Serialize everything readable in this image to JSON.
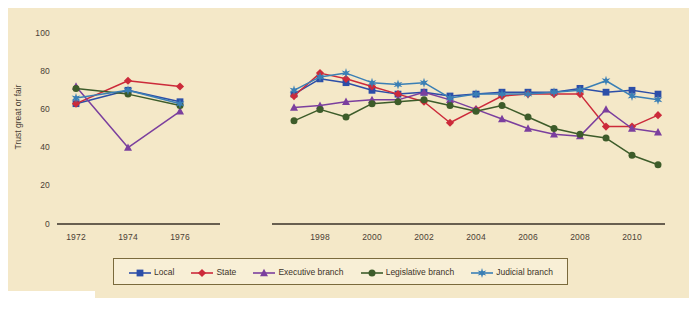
{
  "chart_data": {
    "type": "line",
    "title": "",
    "xlabel": "",
    "ylabel": "Trust great or fair",
    "ylim": [
      0,
      100
    ],
    "yticks": [
      0,
      20,
      40,
      60,
      80,
      100
    ],
    "xticks": [
      1972,
      1974,
      1976,
      1998,
      2000,
      2002,
      2004,
      2006,
      2008,
      2010
    ],
    "grid": false,
    "legend_position": "bottom",
    "axis_break": true,
    "series": [
      {
        "name": "Local",
        "color": "#2c4ea8",
        "marker": "square",
        "points": [
          {
            "x": 1972,
            "y": 63
          },
          {
            "x": 1974,
            "y": 70
          },
          {
            "x": 1976,
            "y": 64
          },
          {
            "x": 1997,
            "y": 68
          },
          {
            "x": 1998,
            "y": 76
          },
          {
            "x": 1999,
            "y": 74
          },
          {
            "x": 2000,
            "y": 70
          },
          {
            "x": 2001,
            "y": 68
          },
          {
            "x": 2002,
            "y": 69
          },
          {
            "x": 2003,
            "y": 67
          },
          {
            "x": 2004,
            "y": 68
          },
          {
            "x": 2005,
            "y": 69
          },
          {
            "x": 2006,
            "y": 69
          },
          {
            "x": 2007,
            "y": 69
          },
          {
            "x": 2008,
            "y": 71
          },
          {
            "x": 2009,
            "y": 69
          },
          {
            "x": 2010,
            "y": 70
          },
          {
            "x": 2011,
            "y": 68
          }
        ]
      },
      {
        "name": "State",
        "color": "#cc2a3a",
        "marker": "diamond",
        "points": [
          {
            "x": 1972,
            "y": 63
          },
          {
            "x": 1974,
            "y": 75
          },
          {
            "x": 1976,
            "y": 72
          },
          {
            "x": 1997,
            "y": 67
          },
          {
            "x": 1998,
            "y": 79
          },
          {
            "x": 1999,
            "y": 76
          },
          {
            "x": 2000,
            "y": 72
          },
          {
            "x": 2001,
            "y": 68
          },
          {
            "x": 2002,
            "y": 64
          },
          {
            "x": 2003,
            "y": 53
          },
          {
            "x": 2004,
            "y": 60
          },
          {
            "x": 2005,
            "y": 67
          },
          {
            "x": 2006,
            "y": 68
          },
          {
            "x": 2007,
            "y": 68
          },
          {
            "x": 2008,
            "y": 68
          },
          {
            "x": 2009,
            "y": 51
          },
          {
            "x": 2010,
            "y": 51
          },
          {
            "x": 2011,
            "y": 57
          }
        ]
      },
      {
        "name": "Executive branch",
        "color": "#7b3f9e",
        "marker": "triangle",
        "points": [
          {
            "x": 1972,
            "y": 72
          },
          {
            "x": 1974,
            "y": 40
          },
          {
            "x": 1976,
            "y": 59
          },
          {
            "x": 1997,
            "y": 61
          },
          {
            "x": 1998,
            "y": 62
          },
          {
            "x": 1999,
            "y": 64
          },
          {
            "x": 2000,
            "y": 65
          },
          {
            "x": 2001,
            "y": 65
          },
          {
            "x": 2002,
            "y": 69
          },
          {
            "x": 2003,
            "y": 65
          },
          {
            "x": 2004,
            "y": 60
          },
          {
            "x": 2005,
            "y": 55
          },
          {
            "x": 2006,
            "y": 50
          },
          {
            "x": 2007,
            "y": 47
          },
          {
            "x": 2008,
            "y": 46
          },
          {
            "x": 2009,
            "y": 60
          },
          {
            "x": 2010,
            "y": 50
          },
          {
            "x": 2011,
            "y": 48
          }
        ]
      },
      {
        "name": "Legislative branch",
        "color": "#3d5c2a",
        "marker": "circle",
        "points": [
          {
            "x": 1972,
            "y": 71
          },
          {
            "x": 1974,
            "y": 68
          },
          {
            "x": 1976,
            "y": 62
          },
          {
            "x": 1997,
            "y": 54
          },
          {
            "x": 1998,
            "y": 60
          },
          {
            "x": 1999,
            "y": 56
          },
          {
            "x": 2000,
            "y": 63
          },
          {
            "x": 2001,
            "y": 64
          },
          {
            "x": 2002,
            "y": 65
          },
          {
            "x": 2003,
            "y": 62
          },
          {
            "x": 2004,
            "y": 59
          },
          {
            "x": 2005,
            "y": 62
          },
          {
            "x": 2006,
            "y": 56
          },
          {
            "x": 2007,
            "y": 50
          },
          {
            "x": 2008,
            "y": 47
          },
          {
            "x": 2009,
            "y": 45
          },
          {
            "x": 2010,
            "y": 36
          },
          {
            "x": 2011,
            "y": 31
          }
        ]
      },
      {
        "name": "Judicial branch",
        "color": "#3a7fb5",
        "marker": "star",
        "points": [
          {
            "x": 1972,
            "y": 66
          },
          {
            "x": 1974,
            "y": 70
          },
          {
            "x": 1976,
            "y": 63
          },
          {
            "x": 1997,
            "y": 70
          },
          {
            "x": 1998,
            "y": 77
          },
          {
            "x": 1999,
            "y": 79
          },
          {
            "x": 2000,
            "y": 74
          },
          {
            "x": 2001,
            "y": 73
          },
          {
            "x": 2002,
            "y": 74
          },
          {
            "x": 2003,
            "y": 66
          },
          {
            "x": 2004,
            "y": 68
          },
          {
            "x": 2005,
            "y": 68
          },
          {
            "x": 2006,
            "y": 68
          },
          {
            "x": 2007,
            "y": 69
          },
          {
            "x": 2008,
            "y": 70
          },
          {
            "x": 2009,
            "y": 75
          },
          {
            "x": 2010,
            "y": 67
          },
          {
            "x": 2011,
            "y": 65
          }
        ]
      }
    ]
  },
  "axis": {
    "y_title": "Trust great or fair",
    "y_tick_labels": [
      "100",
      "80",
      "60",
      "40",
      "20",
      "0"
    ],
    "x_tick_labels": [
      "1972",
      "1974",
      "1976",
      "1998",
      "2000",
      "2002",
      "2004",
      "2006",
      "2008",
      "2010"
    ]
  },
  "legend": {
    "items": [
      {
        "label": "Local",
        "color": "#2c4ea8",
        "marker": "square"
      },
      {
        "label": "State",
        "color": "#cc2a3a",
        "marker": "diamond"
      },
      {
        "label": "Executive branch",
        "color": "#7b3f9e",
        "marker": "triangle"
      },
      {
        "label": "Legislative branch",
        "color": "#3d5c2a",
        "marker": "circle"
      },
      {
        "label": "Judicial branch",
        "color": "#3a7fb5",
        "marker": "star"
      }
    ]
  },
  "colors": {
    "background": "#f4e8c8",
    "page": "#ffffff",
    "axis": "#3a3228",
    "text": "#4a4036",
    "legend_border": "#7a6a3c",
    "legend_fill": "#f8efd6"
  }
}
